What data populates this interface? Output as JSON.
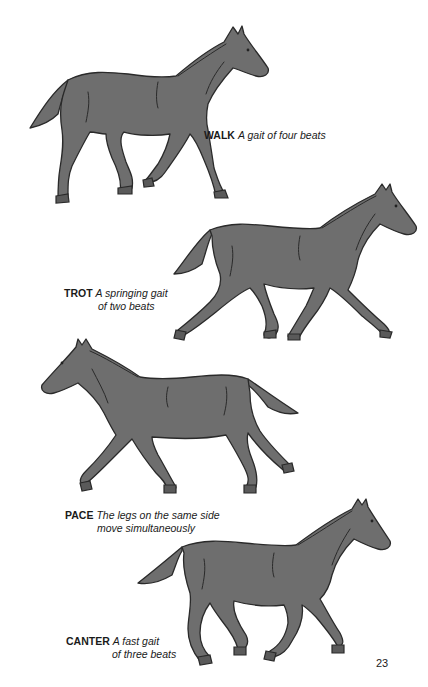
{
  "page": {
    "background": "#ffffff",
    "horse_fill": "#6e6e6e",
    "outline": "#2a2a2a",
    "page_number": "23"
  },
  "gaits": [
    {
      "name": "WALK",
      "description": "A gait of four beats",
      "description_line2": ""
    },
    {
      "name": "TROT",
      "description": "A springing gait",
      "description_line2": "of two beats"
    },
    {
      "name": "PACE",
      "description": "The legs on the same side",
      "description_line2": "move simultaneously"
    },
    {
      "name": "CANTER",
      "description": "A fast gait",
      "description_line2": "of three beats"
    }
  ]
}
